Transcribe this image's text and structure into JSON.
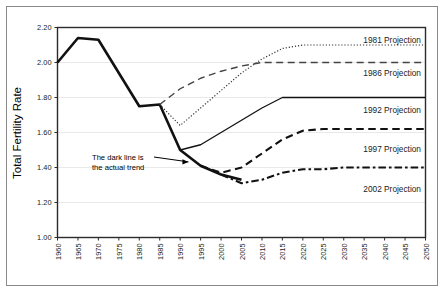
{
  "chart_data": {
    "type": "line",
    "title": "",
    "xlabel": "",
    "ylabel": "Total Fertility Rate",
    "ylim": [
      1.0,
      2.2
    ],
    "xlim": [
      1960,
      2050
    ],
    "grid": true,
    "legend_position": "right-inline",
    "y_ticks": [
      "1.00",
      "1.20",
      "1.40",
      "1.60",
      "1.80",
      "2.00",
      "2.20"
    ],
    "y_tick_values": [
      1.0,
      1.2,
      1.4,
      1.6,
      1.8,
      2.0,
      2.2
    ],
    "x_ticks": [
      "1960",
      "1965",
      "1970",
      "1975",
      "1980",
      "1985",
      "1990",
      "1995",
      "2000",
      "2005",
      "2010",
      "2015",
      "2020",
      "2025",
      "2030",
      "2035",
      "2040",
      "2045",
      "2050"
    ],
    "x_tick_values": [
      1960,
      1965,
      1970,
      1975,
      1980,
      1985,
      1990,
      1995,
      2000,
      2005,
      2010,
      2015,
      2020,
      2025,
      2030,
      2035,
      2040,
      2045,
      2050
    ],
    "annotations": [
      {
        "name": "actual-trend-note",
        "line1": "The dark line is",
        "line2": "the actual trend",
        "points_to_year": 1993,
        "points_to_value": 1.455
      }
    ],
    "series": [
      {
        "name": "Actual trend",
        "legend_label": "",
        "style": "solid-thick",
        "color": "#111111",
        "x": [
          1960,
          1965,
          1970,
          1975,
          1980,
          1985,
          1990,
          1995,
          2000,
          2005
        ],
        "values": [
          2.0,
          2.14,
          2.13,
          1.94,
          1.75,
          1.76,
          1.5,
          1.41,
          1.36,
          1.33
        ]
      },
      {
        "name": "1981 Projection",
        "legend_label": "1981 Projection",
        "style": "dotted",
        "color": "#333333",
        "x": [
          1985,
          1990,
          1995,
          2000,
          2005,
          2010,
          2015,
          2020,
          2025,
          2030,
          2035,
          2040,
          2045,
          2050
        ],
        "values": [
          1.76,
          1.64,
          1.74,
          1.84,
          1.94,
          2.02,
          2.08,
          2.1,
          2.1,
          2.1,
          2.1,
          2.1,
          2.1,
          2.1
        ]
      },
      {
        "name": "1986 Projection",
        "legend_label": "1986 Projection",
        "style": "long-dash",
        "color": "#444444",
        "x": [
          1985,
          1990,
          1995,
          2000,
          2005,
          2010,
          2015,
          2020,
          2025,
          2030,
          2035,
          2040,
          2045,
          2050
        ],
        "values": [
          1.76,
          1.85,
          1.91,
          1.95,
          1.98,
          2.0,
          2.0,
          2.0,
          2.0,
          2.0,
          2.0,
          2.0,
          2.0,
          2.0
        ]
      },
      {
        "name": "1992 Projection",
        "legend_label": "1992 Projection",
        "style": "solid-thin",
        "color": "#111111",
        "x": [
          1990,
          1995,
          2000,
          2005,
          2010,
          2015,
          2020,
          2025,
          2030,
          2035,
          2040,
          2045,
          2050
        ],
        "values": [
          1.5,
          1.53,
          1.6,
          1.67,
          1.74,
          1.8,
          1.8,
          1.8,
          1.8,
          1.8,
          1.8,
          1.8,
          1.8
        ]
      },
      {
        "name": "1997 Projection",
        "legend_label": "1997 Projection",
        "style": "dash",
        "color": "#111111",
        "x": [
          1995,
          2000,
          2005,
          2010,
          2015,
          2020,
          2025,
          2030,
          2035,
          2040,
          2045,
          2050
        ],
        "values": [
          1.41,
          1.37,
          1.4,
          1.48,
          1.56,
          1.61,
          1.62,
          1.62,
          1.62,
          1.62,
          1.62,
          1.62
        ]
      },
      {
        "name": "2002 Projection",
        "legend_label": "2002 Projection",
        "style": "dash-dot",
        "color": "#111111",
        "x": [
          2000,
          2005,
          2010,
          2015,
          2020,
          2025,
          2030,
          2035,
          2040,
          2045,
          2050
        ],
        "values": [
          1.36,
          1.31,
          1.33,
          1.37,
          1.39,
          1.39,
          1.4,
          1.4,
          1.4,
          1.4,
          1.4
        ]
      }
    ],
    "legend_entries": [
      {
        "label": "1981 Projection",
        "x": 421,
        "y": 43,
        "style": "dotted"
      },
      {
        "label": "1986 Projection",
        "x": 421,
        "y": 76,
        "style": "long-dash"
      },
      {
        "label": "1992 Projection",
        "x": 421,
        "y": 113,
        "style": "solid-thin"
      },
      {
        "label": "1997 Projection",
        "x": 421,
        "y": 152,
        "style": "dash"
      },
      {
        "label": "2002 Projection",
        "x": 421,
        "y": 192,
        "style": "dash-dot"
      }
    ]
  }
}
